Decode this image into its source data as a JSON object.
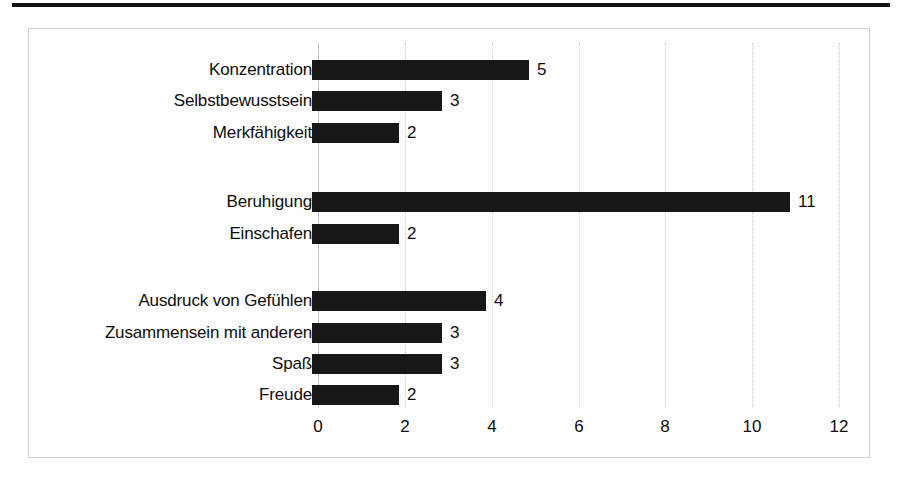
{
  "chart_data": {
    "type": "bar",
    "orientation": "horizontal",
    "title": "",
    "xlabel": "",
    "ylabel": "",
    "xlim": [
      0,
      12
    ],
    "xticks": [
      "0",
      "2",
      "4",
      "6",
      "8",
      "10",
      "12"
    ],
    "grid": true,
    "legend": false,
    "bar_color": "#171717",
    "grid_color": "#cfcfcf",
    "categories": [
      "Konzentration",
      "Selbstbewusstsein",
      "Merkfähigkeit",
      "",
      "Beruhigung",
      "Einschafen",
      "",
      "Ausdruck von Gefühlen",
      "Zusammensein mit anderen",
      "Spaß",
      "Freude"
    ],
    "values": [
      5,
      3,
      2,
      null,
      11,
      2,
      null,
      4,
      3,
      3,
      2
    ],
    "data_labels": [
      "5",
      "3",
      "2",
      "",
      "11",
      "2",
      "",
      "4",
      "3",
      "3",
      "2"
    ]
  },
  "rows": [
    {
      "label": "Konzentration",
      "value": 5,
      "data_label": "5",
      "top": 17
    },
    {
      "label": "Selbstbewusstsein",
      "value": 3,
      "data_label": "3",
      "top": 48
    },
    {
      "label": "Merkfähigkeit",
      "value": 2,
      "data_label": "2",
      "top": 80
    },
    {
      "label": "Beruhigung",
      "value": 11,
      "data_label": "11",
      "top": 149
    },
    {
      "label": "Einschafen",
      "value": 2,
      "data_label": "2",
      "top": 181
    },
    {
      "label": "Ausdruck von Gefühlen",
      "value": 4,
      "data_label": "4",
      "top": 248
    },
    {
      "label": "Zusammensein mit anderen",
      "value": 3,
      "data_label": "3",
      "top": 280
    },
    {
      "label": "Spaß",
      "value": 3,
      "data_label": "3",
      "top": 311
    },
    {
      "label": "Freude",
      "value": 2,
      "data_label": "2",
      "top": 342
    }
  ],
  "x_ticks": [
    {
      "label": "0",
      "value": 0
    },
    {
      "label": "2",
      "value": 2
    },
    {
      "label": "4",
      "value": 4
    },
    {
      "label": "6",
      "value": 6
    },
    {
      "label": "8",
      "value": 8
    },
    {
      "label": "10",
      "value": 10
    },
    {
      "label": "12",
      "value": 12
    }
  ]
}
